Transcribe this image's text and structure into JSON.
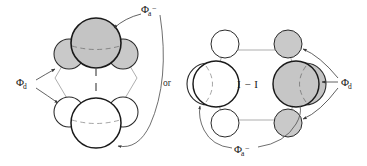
{
  "figure": {
    "background_color": "#ffffff",
    "stroke_color": "#1a1a1a",
    "thin_stroke_color": "#6b6b6b",
    "shaded_fill": "#c9c9c9",
    "unshaded_fill": "#ffffff",
    "labels": {
      "acceptor_symbol": "Φ",
      "acceptor_subscript": "a",
      "acceptor_superscript": "−",
      "donor_symbol": "Φ",
      "donor_subscript": "d",
      "connector": "or",
      "bond_label": "I − I"
    },
    "panels": [
      {
        "id": "left-panel",
        "name": "stacked-arrangement",
        "description": "Two lobe clusters stacked vertically linked by a dashed vertical bond",
        "clusters": [
          {
            "id": "top-cluster",
            "shading": "shaded",
            "role": "acceptor",
            "lobes": 3
          },
          {
            "id": "bottom-cluster",
            "shading": "unshaded",
            "role": "donor",
            "lobes": 3
          }
        ],
        "annotations": [
          {
            "id": "phi-a-top",
            "text_symbol": "Φ",
            "text_sub": "a",
            "text_sup": "−",
            "points_to": "top-cluster"
          },
          {
            "id": "phi-d-left",
            "text_symbol": "Φ",
            "text_sub": "d",
            "text_sup": "",
            "points_to": "bottom-cluster"
          },
          {
            "id": "or-connector",
            "text_symbol": "or",
            "text_sub": "",
            "text_sup": ""
          }
        ]
      },
      {
        "id": "right-panel",
        "name": "side-by-side-arrangement",
        "description": "Two lobe clusters placed side by side joined by an I-I bond",
        "clusters": [
          {
            "id": "left-cluster",
            "shading": "unshaded",
            "role": "acceptor",
            "lobes": 4
          },
          {
            "id": "right-cluster",
            "shading": "shaded",
            "role": "donor",
            "lobes": 4
          }
        ],
        "annotations": [
          {
            "id": "phi-d-right",
            "text_symbol": "Φ",
            "text_sub": "d",
            "text_sup": "",
            "points_to": "right-cluster"
          },
          {
            "id": "phi-a-bottom",
            "text_symbol": "Φ",
            "text_sub": "a",
            "text_sup": "−",
            "points_to": "left-cluster"
          },
          {
            "id": "bond-center",
            "text_symbol": "I − I",
            "text_sub": "",
            "text_sup": ""
          }
        ]
      }
    ]
  }
}
